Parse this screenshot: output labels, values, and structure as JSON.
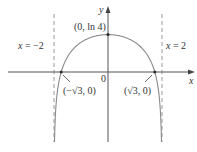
{
  "chart_data": {
    "type": "line",
    "title": "",
    "function": "y = ln(4 - x^2)",
    "xlabel": "x",
    "ylabel": "y",
    "origin_label": "0",
    "asymptotes": [
      {
        "x": -2,
        "label": "x = −2",
        "style": "dashed"
      },
      {
        "x": 2,
        "label": "x = 2",
        "style": "dashed"
      }
    ],
    "points": [
      {
        "x": 0,
        "y": 1.386,
        "label": "(0, ln 4)"
      },
      {
        "x": -1.732,
        "y": 0,
        "label": "(−√3, 0)"
      },
      {
        "x": 1.732,
        "y": 0,
        "label": "(√3, 0)"
      }
    ],
    "xlim": [
      -4,
      3.2
    ],
    "ylim": [
      -2.6,
      2.6
    ],
    "grid": false,
    "colors": {
      "curve": "#8a8a8a",
      "axis": "#555555",
      "asymptote": "#999999",
      "point": "#333333"
    }
  },
  "labels": {
    "y_axis": "y",
    "x_axis": "x",
    "origin": "0",
    "peak": "(0, ln 4)",
    "left_asymptote_x": "x",
    "left_asymptote_rest": " = −2",
    "right_asymptote_x": "x",
    "right_asymptote_rest": " = 2",
    "left_root": "(−√3, 0)",
    "right_root": "(√3, 0)"
  }
}
